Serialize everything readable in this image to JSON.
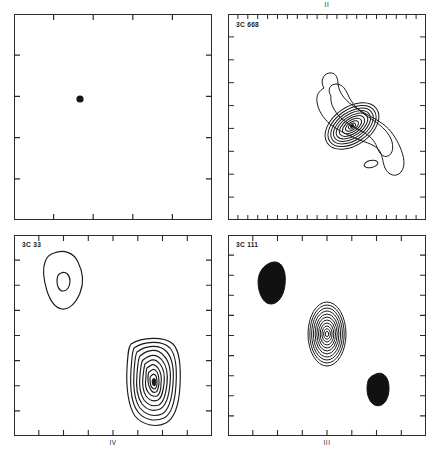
{
  "figure": {
    "kind": "radio-contour-map-grid",
    "background": "#ffffff",
    "line_color": "#1a1a1a",
    "panel_count": 4
  },
  "panels": [
    {
      "id": "panel-1",
      "roman_numeral": "I",
      "roman_position": "none",
      "source_label": "",
      "ticks": {
        "top": 4,
        "bottom": 4,
        "left": 4,
        "right": 4,
        "density": "sparse"
      },
      "features": [
        {
          "type": "point-source",
          "name": "unresolved-core",
          "cx_pct": 33.5,
          "cy_pct": 41.5,
          "r_px": 3.6,
          "filled": true
        }
      ]
    },
    {
      "id": "panel-2",
      "roman_numeral": "II",
      "roman_position": "above",
      "source_label": "3C 668",
      "ticks": {
        "top": 20,
        "bottom": 20,
        "left": 8,
        "right": 8,
        "density": "fine"
      },
      "features": [
        {
          "type": "contour-envelope",
          "name": "s-shaped-jet-envelope"
        },
        {
          "type": "nested-contours",
          "name": "bright-core",
          "levels": 8,
          "cx_pct": 62,
          "cy_pct": 58,
          "tilt_deg": -35
        },
        {
          "type": "small-ellipse",
          "name": "secondary-knot",
          "cx_pct": 72,
          "cy_pct": 73
        }
      ]
    },
    {
      "id": "panel-4",
      "roman_numeral": "IV",
      "roman_position": "below",
      "source_label": "3C 33",
      "ticks": {
        "top": 8,
        "bottom": 8,
        "left": 8,
        "right": 8,
        "density": "medium"
      },
      "features": [
        {
          "type": "open-contour-blob",
          "name": "northern-lobe",
          "levels": 2,
          "cx_pct": 24,
          "cy_pct": 23
        },
        {
          "type": "nested-contours",
          "name": "southern-hotspot",
          "levels": 10,
          "cx_pct": 71,
          "cy_pct": 72
        }
      ]
    },
    {
      "id": "panel-3",
      "roman_numeral": "III",
      "roman_position": "below",
      "source_label": "3C 111",
      "ticks": {
        "top": 8,
        "bottom": 8,
        "left": 10,
        "right": 10,
        "density": "medium"
      },
      "features": [
        {
          "type": "filled-blob",
          "name": "north-east-lobe",
          "cx_pct": 20,
          "cy_pct": 21
        },
        {
          "type": "nested-contours",
          "name": "central-core",
          "levels": 11,
          "cx_pct": 50,
          "cy_pct": 49
        },
        {
          "type": "filled-blob",
          "name": "south-west-lobe",
          "cx_pct": 75,
          "cy_pct": 75
        }
      ]
    }
  ],
  "labels": {
    "panel_ii": "II",
    "panel_iii": "III",
    "panel_iv": "IV",
    "source_3c668": "3C 668",
    "source_3c33": "3C 33",
    "source_3c111": "3C 111"
  }
}
